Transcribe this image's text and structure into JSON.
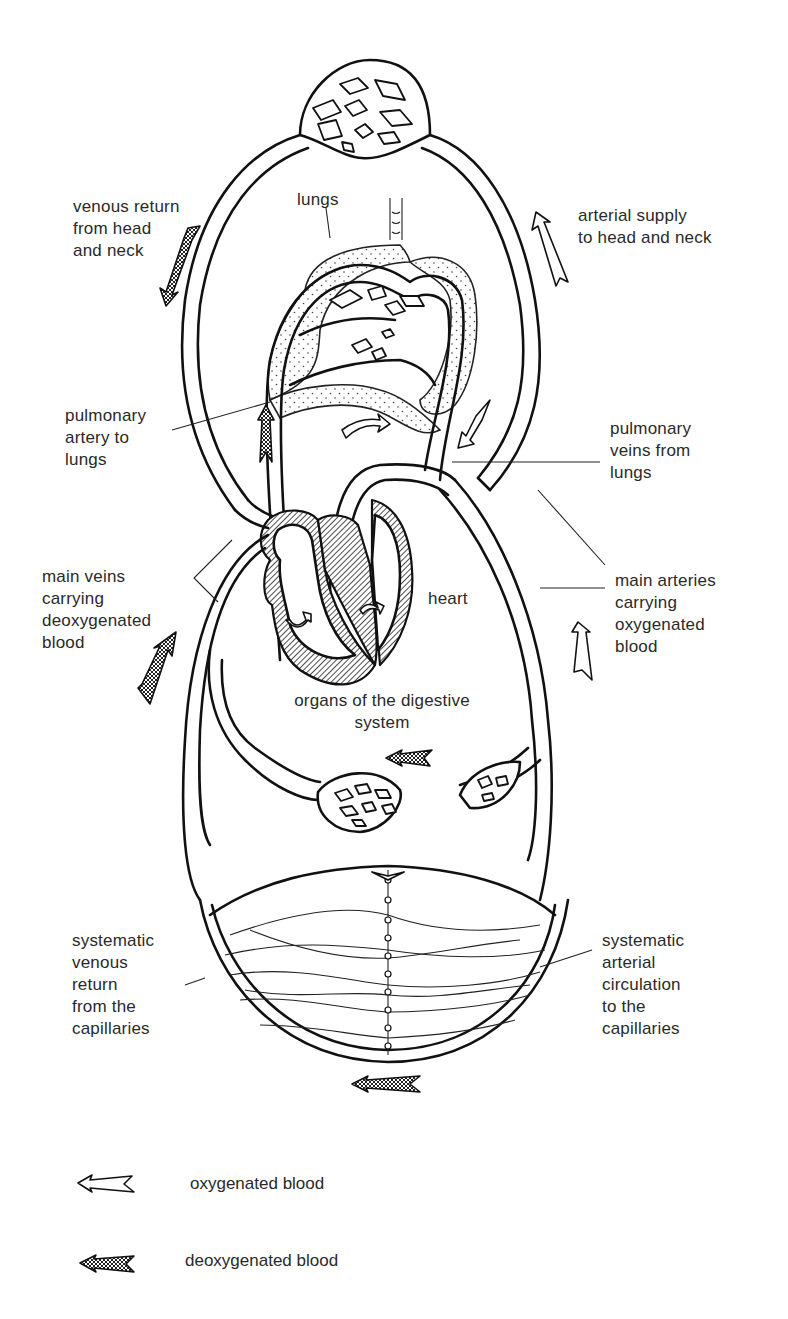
{
  "diagram": {
    "colors": {
      "line": "#111111",
      "text": "#2a2a2a",
      "background": "#ffffff"
    }
  },
  "labels": {
    "venous_head": "venous return\nfrom head\nand neck",
    "arterial_head": "arterial supply\nto head and neck",
    "lungs": "lungs",
    "pulmonary_artery": "pulmonary\nartery to\nlungs",
    "pulmonary_veins": "pulmonary\nveins from\nlungs",
    "main_veins": "main veins\ncarrying\ndeoxygenated\nblood",
    "heart": "heart",
    "main_arteries": "main arteries\ncarrying\noxygenated\nblood",
    "digestive": "organs of the digestive\nsystem",
    "systematic_venous": "systematic\nvenous\nreturn\nfrom the\ncapillaries",
    "systematic_arterial": "systematic\narterial\ncirculation\nto the\ncapillaries"
  },
  "legend": {
    "items": [
      {
        "icon": "oxygenated-arrow-icon",
        "label": "oxygenated blood"
      },
      {
        "icon": "deoxygenated-arrow-icon",
        "label": "deoxygenated blood"
      }
    ]
  }
}
